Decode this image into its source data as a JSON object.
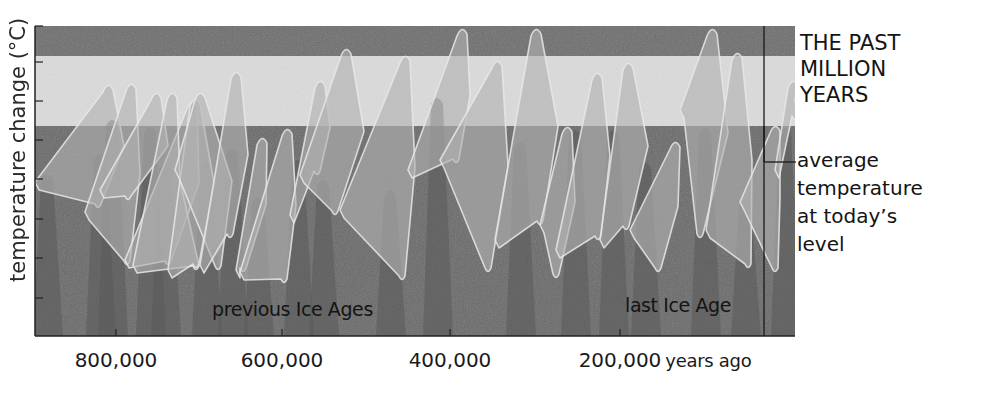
{
  "title": [
    "THE PAST",
    "MILLION",
    "YEARS"
  ],
  "ylabel": "temperature change (°C)",
  "xaxis": {
    "ticks": [
      {
        "label": "800,000",
        "x": 116
      },
      {
        "label": "600,000",
        "x": 282
      },
      {
        "label": "400,000",
        "x": 450
      },
      {
        "label": "200,000",
        "x": 620
      }
    ],
    "suffix": "years ago"
  },
  "annotation": [
    "average",
    "temperature",
    "at today’s",
    "level"
  ],
  "labels": {
    "previous": "previous Ice Ages",
    "last": "last Ice Age"
  },
  "colors": {
    "top_band": "#6e6e6e",
    "warm_band": "#dcdcdc",
    "cold_region": "#6a6a6a",
    "curve_fill": "#b2b2b2",
    "curve_fill_shadow": "#8c8c8c",
    "curve_stroke": "#e8e8e8",
    "axis": "#222222"
  },
  "chart_data": {
    "type": "area",
    "title": "THE PAST MILLION YEARS",
    "xlabel": "years ago",
    "ylabel": "temperature change (°C)",
    "x_ticks": [
      "800,000",
      "600,000",
      "400,000",
      "200,000"
    ],
    "x_range_years_ago": [
      900000,
      0
    ],
    "y_ticks_count": 8,
    "y_tick_labels": [],
    "grid": false,
    "reference_line": {
      "label": "average temperature at today’s level",
      "band_boundary": true
    },
    "regions": [
      {
        "label": "previous Ice Ages",
        "x_years_ago": [
          820000,
          130000
        ]
      },
      {
        "label": "last Ice Age",
        "x_years_ago": [
          110000,
          12000
        ]
      }
    ],
    "series": [
      {
        "name": "temperature cycles (stylised sawtooth)",
        "cycles_years_ago": [
          {
            "start": 900000,
            "peak": 865000,
            "trough": 850000
          },
          {
            "start": 850000,
            "peak": 810000,
            "trough": 797000
          },
          {
            "start": 797000,
            "peak": 780000,
            "trough": 770000
          },
          {
            "start": 770000,
            "peak": 745000,
            "trough": 725000
          },
          {
            "start": 725000,
            "peak": 700000,
            "trough": 690000
          },
          {
            "start": 690000,
            "peak": 675000,
            "trough": 665000
          },
          {
            "start": 665000,
            "peak": 625000,
            "trough": 610000
          },
          {
            "start": 610000,
            "peak": 580000,
            "trough": 560000
          },
          {
            "start": 560000,
            "peak": 525000,
            "trough": 505000
          },
          {
            "start": 505000,
            "peak": 465000,
            "trough": 445000
          },
          {
            "start": 445000,
            "peak": 400000,
            "trough": 370000
          },
          {
            "start": 370000,
            "peak": 320000,
            "trough": 290000
          },
          {
            "start": 290000,
            "peak": 240000,
            "trough": 215000
          },
          {
            "start": 215000,
            "peak": 130000,
            "trough": 110000
          },
          {
            "start": 110000,
            "peak": 125000,
            "trough": 20000
          },
          {
            "start": 20000,
            "peak": 8000,
            "trough": 0
          }
        ]
      }
    ]
  },
  "plot": {
    "left": 35,
    "right": 795,
    "top": 26,
    "bottom": 336,
    "band_top_bottom": 56,
    "today_level_y": 126,
    "today_line_x": 764,
    "bracket_y": 162,
    "y_ticks": [
      62,
      101,
      140,
      179,
      219,
      258,
      298
    ],
    "cycles": [
      {
        "x0": 35,
        "y0": 182,
        "xp": 108,
        "yp": 84,
        "xd": 124,
        "xt": 98,
        "yt": 208
      },
      {
        "x0": 85,
        "y0": 212,
        "xp": 131,
        "yp": 83,
        "xd": 140,
        "xt": 127,
        "yt": 265
      },
      {
        "x0": 100,
        "y0": 190,
        "xp": 156,
        "yp": 92,
        "xd": 168,
        "xt": 128,
        "yt": 200
      },
      {
        "x0": 125,
        "y0": 260,
        "xp": 192,
        "yp": 101,
        "xd": 199,
        "xt": 168,
        "yt": 265
      },
      {
        "x0": 133,
        "y0": 265,
        "xp": 172,
        "yp": 92,
        "xd": 180,
        "xt": 196,
        "yt": 270
      },
      {
        "x0": 168,
        "y0": 270,
        "xp": 195,
        "yp": 98,
        "xd": 214,
        "xt": 196,
        "yt": 268
      },
      {
        "x0": 175,
        "y0": 170,
        "xp": 200,
        "yp": 92,
        "xd": 232,
        "xt": 218,
        "yt": 270
      },
      {
        "x0": 200,
        "y0": 265,
        "xp": 236,
        "yp": 71,
        "xd": 248,
        "xt": 230,
        "yt": 238
      },
      {
        "x0": 236,
        "y0": 270,
        "xp": 262,
        "yp": 137,
        "xd": 266,
        "xt": 243,
        "yt": 272
      },
      {
        "x0": 240,
        "y0": 272,
        "xp": 287,
        "yp": 128,
        "xd": 296,
        "xt": 284,
        "yt": 283
      },
      {
        "x0": 290,
        "y0": 215,
        "xp": 320,
        "yp": 80,
        "xd": 330,
        "xt": 317,
        "yt": 175
      },
      {
        "x0": 300,
        "y0": 175,
        "xp": 346,
        "yp": 48,
        "xd": 364,
        "xt": 335,
        "yt": 215
      },
      {
        "x0": 340,
        "y0": 210,
        "xp": 405,
        "yp": 55,
        "xd": 415,
        "xt": 402,
        "yt": 280
      },
      {
        "x0": 408,
        "y0": 170,
        "xp": 462,
        "yp": 28,
        "xd": 470,
        "xt": 456,
        "yt": 163
      },
      {
        "x0": 440,
        "y0": 160,
        "xp": 497,
        "yp": 60,
        "xd": 508,
        "xt": 488,
        "yt": 272
      },
      {
        "x0": 495,
        "y0": 240,
        "xp": 536,
        "yp": 28,
        "xd": 558,
        "xt": 540,
        "yt": 225
      },
      {
        "x0": 540,
        "y0": 225,
        "xp": 567,
        "yp": 126,
        "xd": 575,
        "xt": 556,
        "yt": 278
      },
      {
        "x0": 556,
        "y0": 250,
        "xp": 597,
        "yp": 72,
        "xd": 610,
        "xt": 598,
        "yt": 240
      },
      {
        "x0": 600,
        "y0": 240,
        "xp": 628,
        "yp": 62,
        "xd": 648,
        "xt": 626,
        "yt": 230
      },
      {
        "x0": 630,
        "y0": 230,
        "xp": 675,
        "yp": 141,
        "xd": 678,
        "xt": 658,
        "yt": 272
      },
      {
        "x0": 680,
        "y0": 110,
        "xp": 712,
        "yp": 28,
        "xd": 728,
        "xt": 700,
        "yt": 238
      },
      {
        "x0": 706,
        "y0": 230,
        "xp": 737,
        "yp": 52,
        "xd": 752,
        "xt": 748,
        "yt": 268
      },
      {
        "x0": 740,
        "y0": 202,
        "xp": 775,
        "yp": 125,
        "xd": 780,
        "xt": 775,
        "yt": 272
      },
      {
        "x0": 775,
        "y0": 170,
        "xp": 793,
        "yp": 80,
        "xd": 795,
        "xt": 795,
        "yt": 120
      }
    ],
    "shadow_peaks": [
      {
        "x": 47,
        "y": 172
      },
      {
        "x": 100,
        "y": 152
      },
      {
        "x": 112,
        "y": 118
      },
      {
        "x": 150,
        "y": 125
      },
      {
        "x": 165,
        "y": 162
      },
      {
        "x": 206,
        "y": 160
      },
      {
        "x": 232,
        "y": 147
      },
      {
        "x": 258,
        "y": 195
      },
      {
        "x": 298,
        "y": 158
      },
      {
        "x": 323,
        "y": 178
      },
      {
        "x": 390,
        "y": 188
      },
      {
        "x": 437,
        "y": 96
      },
      {
        "x": 520,
        "y": 140
      },
      {
        "x": 575,
        "y": 128
      },
      {
        "x": 613,
        "y": 128
      },
      {
        "x": 645,
        "y": 160
      },
      {
        "x": 705,
        "y": 126
      },
      {
        "x": 745,
        "y": 198
      },
      {
        "x": 785,
        "y": 126
      }
    ]
  }
}
